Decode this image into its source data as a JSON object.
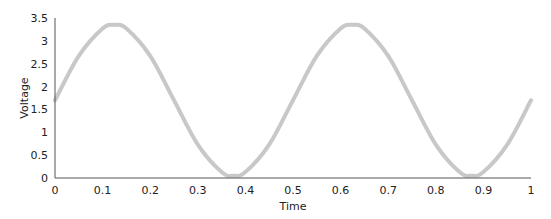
{
  "chart_data": {
    "type": "line",
    "title": "",
    "xlabel": "Time",
    "ylabel": "Voltage",
    "xlim": [
      0,
      1
    ],
    "ylim": [
      0,
      3.5
    ],
    "x_ticks": [
      "0",
      "0.1",
      "0.2",
      "0.3",
      "0.4",
      "0.5",
      "0.6",
      "0.7",
      "0.8",
      "0.9",
      "1"
    ],
    "y_ticks": [
      "0",
      "0.5",
      "1",
      "1.5",
      "2",
      "2.5",
      "3",
      "3.5"
    ],
    "grid": false,
    "legend": null,
    "series": [
      {
        "name": "Voltage",
        "color": "#c8c8c8",
        "x": [
          0,
          0.05,
          0.1,
          0.125,
          0.15,
          0.2,
          0.25,
          0.3,
          0.35,
          0.375,
          0.4,
          0.45,
          0.5,
          0.55,
          0.6,
          0.625,
          0.65,
          0.7,
          0.75,
          0.8,
          0.85,
          0.875,
          0.9,
          0.95,
          1
        ],
        "values": [
          1.7,
          2.67,
          3.27,
          3.35,
          3.27,
          2.67,
          1.7,
          0.73,
          0.13,
          0.05,
          0.13,
          0.73,
          1.7,
          2.67,
          3.27,
          3.35,
          3.27,
          2.67,
          1.7,
          0.73,
          0.13,
          0.05,
          0.13,
          0.73,
          1.7
        ]
      }
    ]
  },
  "axis_color": "#555555"
}
